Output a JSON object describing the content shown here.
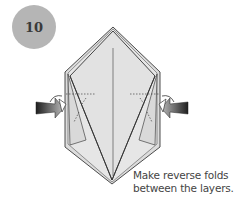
{
  "step": {
    "number": "10"
  },
  "caption": {
    "line1": "Make reverse folds",
    "line2": "between the layers."
  },
  "colors": {
    "badge": "#b5b5b5",
    "paper": "#e3e3e3",
    "paper_back": "#d6d6d6",
    "outline": "#3a3a3a",
    "arrow_dark": "#2a2a2a"
  }
}
